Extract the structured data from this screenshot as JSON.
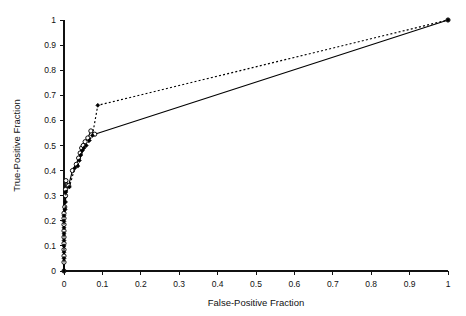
{
  "chart_data": {
    "type": "line",
    "title": "",
    "xlabel": "False-Positive Fraction",
    "ylabel": "True-Positive Fraction",
    "xlim": [
      0,
      1
    ],
    "ylim": [
      0,
      1
    ],
    "xticks": [
      "0",
      "0.1",
      "0.2",
      "0.3",
      "0.4",
      "0.5",
      "0.6",
      "0.7",
      "0.8",
      "0.9",
      "1"
    ],
    "yticks": [
      "0",
      "0.1",
      "0.2",
      "0.3",
      "0.4",
      "0.5",
      "0.6",
      "0.7",
      "0.8",
      "0.9",
      "1"
    ],
    "xtick_values": [
      0,
      0.1,
      0.2,
      0.3,
      0.4,
      0.5,
      0.6,
      0.7,
      0.8,
      0.9,
      1
    ],
    "ytick_values": [
      0,
      0.1,
      0.2,
      0.3,
      0.4,
      0.5,
      0.6,
      0.7,
      0.8,
      0.9,
      1
    ],
    "grid": false,
    "legend": "none",
    "background": "#ffffff",
    "series": [
      {
        "name": "ROC curve 1",
        "line_style": "solid",
        "marker": "open-circle",
        "color": "#000000",
        "points": [
          [
            0.0,
            0.0
          ],
          [
            0.0,
            0.035
          ],
          [
            0.0,
            0.06
          ],
          [
            0.0,
            0.085
          ],
          [
            0.0,
            0.11
          ],
          [
            0.0,
            0.135
          ],
          [
            0.0,
            0.16
          ],
          [
            0.0,
            0.185
          ],
          [
            0.0,
            0.21
          ],
          [
            0.0,
            0.23
          ],
          [
            0.002,
            0.255
          ],
          [
            0.004,
            0.3
          ],
          [
            0.004,
            0.325
          ],
          [
            0.005,
            0.36
          ],
          [
            0.012,
            0.34
          ],
          [
            0.022,
            0.4
          ],
          [
            0.032,
            0.425
          ],
          [
            0.038,
            0.45
          ],
          [
            0.042,
            0.47
          ],
          [
            0.046,
            0.49
          ],
          [
            0.05,
            0.5
          ],
          [
            0.055,
            0.515
          ],
          [
            0.062,
            0.53
          ],
          [
            0.07,
            0.558
          ],
          [
            0.08,
            0.545
          ],
          [
            1.0,
            1.0
          ]
        ]
      },
      {
        "name": "ROC curve 2",
        "line_style": "dotted",
        "marker": "filled-diamond",
        "color": "#000000",
        "points": [
          [
            0.0,
            0.0
          ],
          [
            0.0,
            0.05
          ],
          [
            0.0,
            0.075
          ],
          [
            0.0,
            0.1
          ],
          [
            0.0,
            0.122
          ],
          [
            0.0,
            0.148
          ],
          [
            0.0,
            0.172
          ],
          [
            0.0,
            0.198
          ],
          [
            0.0,
            0.22
          ],
          [
            0.003,
            0.245
          ],
          [
            0.004,
            0.275
          ],
          [
            0.005,
            0.315
          ],
          [
            0.014,
            0.335
          ],
          [
            0.028,
            0.41
          ],
          [
            0.036,
            0.418
          ],
          [
            0.04,
            0.44
          ],
          [
            0.044,
            0.462
          ],
          [
            0.048,
            0.48
          ],
          [
            0.052,
            0.49
          ],
          [
            0.058,
            0.5
          ],
          [
            0.066,
            0.52
          ],
          [
            0.074,
            0.54
          ],
          [
            0.088,
            0.66
          ],
          [
            1.0,
            1.0
          ]
        ]
      }
    ]
  }
}
